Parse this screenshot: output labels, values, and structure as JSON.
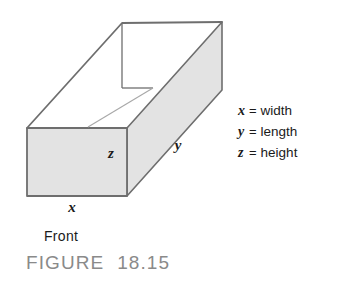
{
  "figure": {
    "caption": "FIGURE  18.15",
    "front_label": "Front",
    "shape": "rectangular-box-open-top",
    "edge_color": "#6e6e6e",
    "face_fill": "#e3e3e3",
    "text_color": "#1a1a1a",
    "caption_color": "#8a8a8a"
  },
  "dimension_labels": {
    "x": "x",
    "y": "y",
    "z": "z"
  },
  "legend": {
    "equals": "=",
    "rows": [
      {
        "symbol": "x",
        "name": "width"
      },
      {
        "symbol": "y",
        "name": "length"
      },
      {
        "symbol": "z",
        "name": "height"
      }
    ]
  }
}
